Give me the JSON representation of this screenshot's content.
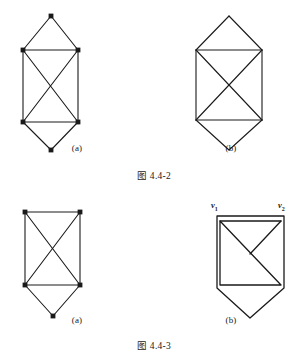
{
  "page": {
    "background": "#ffffff",
    "ink": "#1a1a1a",
    "figures": [
      {
        "id": "fig-4-4-2",
        "caption": "图 4.4-2",
        "panels": [
          {
            "label": "(a)",
            "description": "six-vertex graph: top apex, two upper vertices, two lower vertices, bottom apex; rectangle with both diagonals",
            "vertices_visible": true,
            "edge_style": "straight",
            "vertices": [
              {
                "id": "t",
                "x": 51,
                "y": 16
              },
              {
                "id": "ul",
                "x": 23,
                "y": 50
              },
              {
                "id": "ur",
                "x": 78,
                "y": 50
              },
              {
                "id": "ll",
                "x": 23,
                "y": 122
              },
              {
                "id": "lr",
                "x": 78,
                "y": 122
              },
              {
                "id": "b",
                "x": 51,
                "y": 150
              }
            ],
            "edges": [
              [
                "t",
                "ul"
              ],
              [
                "t",
                "ur"
              ],
              [
                "ul",
                "ur"
              ],
              [
                "ul",
                "ll"
              ],
              [
                "ur",
                "lr"
              ],
              [
                "ul",
                "lr"
              ],
              [
                "ur",
                "ll"
              ],
              [
                "ll",
                "lr"
              ],
              [
                "ll",
                "b"
              ],
              [
                "lr",
                "b"
              ]
            ]
          },
          {
            "label": "(b)",
            "description": "same six-vertex graph drawn without vertex dots",
            "vertices_visible": false,
            "edge_style": "straight",
            "vertices": [
              {
                "id": "t",
                "x": 75,
                "y": 16
              },
              {
                "id": "ul",
                "x": 42,
                "y": 50
              },
              {
                "id": "ur",
                "x": 108,
                "y": 50
              },
              {
                "id": "ll",
                "x": 42,
                "y": 120
              },
              {
                "id": "lr",
                "x": 108,
                "y": 120
              },
              {
                "id": "b",
                "x": 75,
                "y": 150
              }
            ],
            "edges": [
              [
                "t",
                "ul"
              ],
              [
                "t",
                "ur"
              ],
              [
                "ul",
                "ur"
              ],
              [
                "ul",
                "ll"
              ],
              [
                "ur",
                "lr"
              ],
              [
                "ul",
                "lr"
              ],
              [
                "ur",
                "ll"
              ],
              [
                "ll",
                "lr"
              ],
              [
                "ll",
                "b"
              ],
              [
                "lr",
                "b"
              ]
            ]
          }
        ]
      },
      {
        "id": "fig-4-4-3",
        "caption": "图 4.4-3",
        "panels": [
          {
            "label": "(a)",
            "description": "five-vertex graph: rectangle with both diagonals plus bottom apex",
            "vertices_visible": true,
            "edge_style": "straight",
            "vertices": [
              {
                "id": "ul",
                "x": 25,
                "y": 22
              },
              {
                "id": "ur",
                "x": 80,
                "y": 22
              },
              {
                "id": "ll",
                "x": 25,
                "y": 95
              },
              {
                "id": "lr",
                "x": 80,
                "y": 95
              },
              {
                "id": "b",
                "x": 53,
                "y": 126
              }
            ],
            "edges": [
              [
                "ul",
                "ur"
              ],
              [
                "ul",
                "ll"
              ],
              [
                "ur",
                "lr"
              ],
              [
                "ul",
                "lr"
              ],
              [
                "ur",
                "ll"
              ],
              [
                "ll",
                "lr"
              ],
              [
                "ll",
                "b"
              ],
              [
                "lr",
                "b"
              ]
            ]
          },
          {
            "label": "(b)",
            "description": "same five-vertex graph drawn with rounded-corner closed outline, vertices v1 and v2 labelled at top",
            "vertices_visible": false,
            "edge_style": "rounded",
            "vertices": [
              {
                "id": "v1",
                "x": 63,
                "y": 26,
                "label": "v1"
              },
              {
                "id": "v2",
                "x": 130,
                "y": 26,
                "label": "v2"
              },
              {
                "id": "ll",
                "x": 63,
                "y": 98
              },
              {
                "id": "lr",
                "x": 130,
                "y": 98
              },
              {
                "id": "b",
                "x": 96,
                "y": 128
              }
            ],
            "edges": [
              [
                "v1",
                "v2"
              ],
              [
                "v1",
                "ll"
              ],
              [
                "v2",
                "lr"
              ],
              [
                "v1",
                "lr"
              ],
              [
                "v2",
                "ll"
              ],
              [
                "ll",
                "lr"
              ],
              [
                "ll",
                "b"
              ],
              [
                "lr",
                "b"
              ]
            ],
            "vertex_labels": [
              {
                "name": "v1",
                "base": "v",
                "sub": "1"
              },
              {
                "name": "v2",
                "base": "v",
                "sub": "2"
              }
            ]
          }
        ]
      }
    ]
  }
}
